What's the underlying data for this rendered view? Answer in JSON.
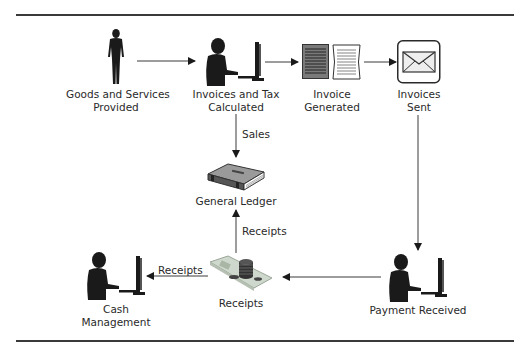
{
  "diagram": {
    "type": "process-flow",
    "nodes": [
      {
        "id": "goods",
        "icon": "standing-person-icon",
        "lines": [
          "Goods and Services",
          "Provided"
        ]
      },
      {
        "id": "invoices_tax",
        "icon": "person-at-computer-icon",
        "lines": [
          "Invoices and Tax",
          "Calculated"
        ]
      },
      {
        "id": "invoice_generated",
        "icon": "documents-icon",
        "lines": [
          "Invoice",
          "Generated"
        ]
      },
      {
        "id": "invoices_sent",
        "icon": "envelope-icon",
        "lines": [
          "Invoices",
          "Sent"
        ]
      },
      {
        "id": "payment_received",
        "icon": "person-at-computer-icon",
        "lines": [
          "Payment Received"
        ]
      },
      {
        "id": "receipts",
        "icon": "money-stack-icon",
        "lines": [
          "Receipts"
        ]
      },
      {
        "id": "general_ledger",
        "icon": "ledger-book-icon",
        "lines": [
          "General Ledger"
        ]
      },
      {
        "id": "cash_management",
        "icon": "person-at-computer-icon",
        "lines": [
          "Cash",
          "Management"
        ]
      }
    ],
    "edges": [
      {
        "from": "goods",
        "to": "invoices_tax",
        "label": ""
      },
      {
        "from": "invoices_tax",
        "to": "invoice_generated",
        "label": ""
      },
      {
        "from": "invoice_generated",
        "to": "invoices_sent",
        "label": ""
      },
      {
        "from": "invoices_tax",
        "to": "general_ledger",
        "label": "Sales"
      },
      {
        "from": "invoices_sent",
        "to": "payment_received",
        "label": ""
      },
      {
        "from": "payment_received",
        "to": "receipts",
        "label": ""
      },
      {
        "from": "receipts",
        "to": "general_ledger",
        "label": "Receipts"
      },
      {
        "from": "receipts",
        "to": "cash_management",
        "label": "Receipts"
      }
    ]
  },
  "labels": {
    "goods": {
      "l1": "Goods and Services",
      "l2": "Provided"
    },
    "invoices_tax": {
      "l1": "Invoices and Tax",
      "l2": "Calculated"
    },
    "invoice_generated": {
      "l1": "Invoice",
      "l2": "Generated"
    },
    "invoices_sent": {
      "l1": "Invoices",
      "l2": "Sent"
    },
    "payment_received": {
      "l1": "Payment Received"
    },
    "receipts": {
      "l1": "Receipts"
    },
    "general_ledger": {
      "l1": "General Ledger"
    },
    "cash_management": {
      "l1": "Cash",
      "l2": "Management"
    }
  },
  "edge_labels": {
    "sales": "Sales",
    "receipts_to_ledger": "Receipts",
    "receipts_to_cash": "Receipts"
  },
  "colors": {
    "line": "#3a3a3a",
    "silhouette": "#1a1a1a",
    "text": "#2a2a2a"
  }
}
